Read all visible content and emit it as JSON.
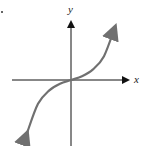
{
  "figure": {
    "x_axis_label": "x",
    "y_axis_label": "y",
    "curve_color": "#707070",
    "axis_color": "#111111"
  },
  "chart_data": {
    "type": "line",
    "title": "",
    "xlabel": "x",
    "ylabel": "y",
    "grid": false,
    "shape": "cubic-like (y ∝ x^3 style), increasing, through origin, arrows at both ends",
    "x": [
      -1.0,
      -0.75,
      -0.5,
      -0.25,
      0,
      0.25,
      0.5,
      0.75,
      1.0
    ],
    "y": [
      -1.0,
      -0.45,
      -0.2,
      -0.07,
      0,
      0.07,
      0.2,
      0.45,
      1.0
    ]
  }
}
